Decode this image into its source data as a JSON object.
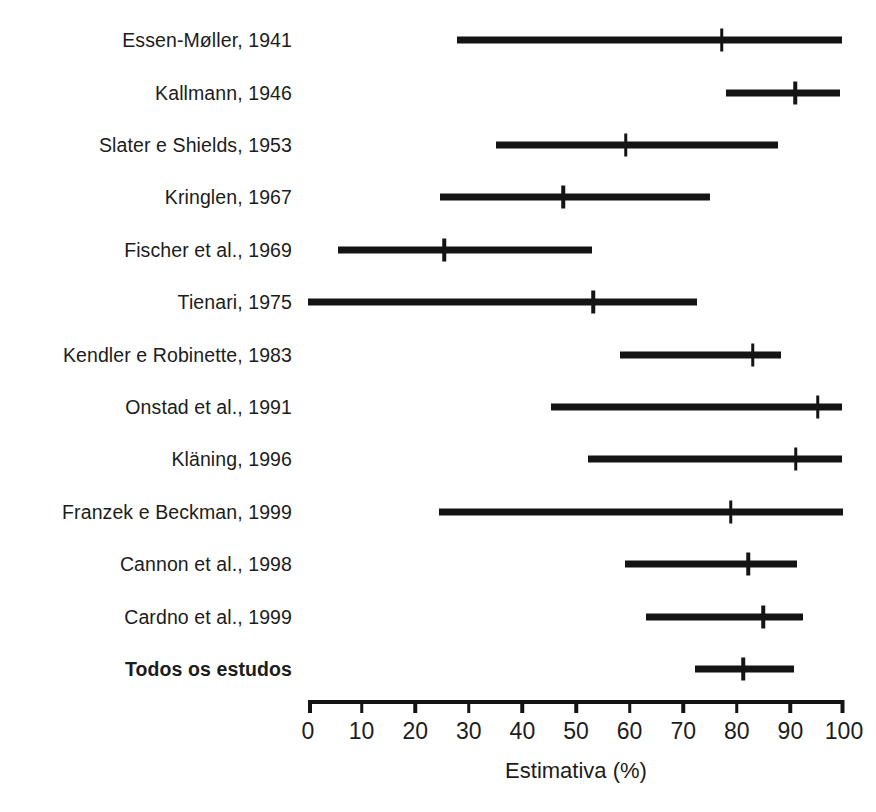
{
  "chart_data": {
    "type": "bar",
    "subtype": "forest-plot",
    "title": "",
    "xlabel": "Estimativa (%)",
    "ylabel": "",
    "xlim": [
      0,
      100
    ],
    "xticks": [
      0,
      10,
      20,
      30,
      40,
      50,
      60,
      70,
      80,
      90,
      100
    ],
    "xticklabels": [
      "0",
      "10",
      "20",
      "30",
      "40",
      "50",
      "60",
      "70",
      "80",
      "90",
      "100"
    ],
    "grid": false,
    "legend": false,
    "accent_color": "#141414",
    "background_color": "#ffffff",
    "categories": [
      "Essen-Møller, 1941",
      "Kallmann, 1946",
      "Slater e Shields, 1953",
      "Kringlen, 1967",
      "Fischer et al., 1969",
      "Tienari, 1975",
      "Kendler e Robinette, 1983",
      "Onstad et al., 1991",
      "Kläning, 1996",
      "Franzek e Beckman, 1999",
      "Cannon et al., 1998",
      "Cardno et al., 1999",
      "Todos os estudos"
    ],
    "series": [
      {
        "name": "Estimativa (%)",
        "values": [
          77.2,
          90.9,
          59.3,
          47.6,
          25.4,
          53.2,
          83.0,
          95.1,
          91.0,
          78.9,
          82.1,
          84.9,
          81.2
        ]
      },
      {
        "name": "IC inferior",
        "values": [
          27.8,
          78.0,
          35.1,
          24.6,
          5.6,
          0.0,
          58.2,
          45.3,
          52.2,
          24.4,
          59.1,
          63.1,
          72.2
        ]
      },
      {
        "name": "IC superior",
        "values": [
          99.6,
          99.3,
          87.7,
          75.0,
          53.0,
          72.6,
          88.2,
          99.6,
          99.6,
          99.8,
          91.2,
          92.4,
          90.7
        ]
      }
    ],
    "rows": [
      {
        "label": "Essen-Møller, 1941",
        "estimate": 77.2,
        "low": 27.8,
        "high": 99.6,
        "summary": false
      },
      {
        "label": "Kallmann, 1946",
        "estimate": 90.9,
        "low": 78.0,
        "high": 99.3,
        "summary": false
      },
      {
        "label": "Slater e Shields, 1953",
        "estimate": 59.3,
        "low": 35.1,
        "high": 87.7,
        "summary": false
      },
      {
        "label": "Kringlen, 1967",
        "estimate": 47.6,
        "low": 24.6,
        "high": 75.0,
        "summary": false
      },
      {
        "label": "Fischer et al., 1969",
        "estimate": 25.4,
        "low": 5.6,
        "high": 53.0,
        "summary": false
      },
      {
        "label": "Tienari, 1975",
        "estimate": 53.2,
        "low": 0.0,
        "high": 72.6,
        "summary": false
      },
      {
        "label": "Kendler e Robinette, 1983",
        "estimate": 83.0,
        "low": 58.2,
        "high": 88.2,
        "summary": false
      },
      {
        "label": "Onstad et al., 1991",
        "estimate": 95.1,
        "low": 45.3,
        "high": 99.6,
        "summary": false
      },
      {
        "label": "Kläning, 1996",
        "estimate": 91.0,
        "low": 52.2,
        "high": 99.6,
        "summary": false
      },
      {
        "label": "Franzek e Beckman, 1999",
        "estimate": 78.9,
        "low": 24.4,
        "high": 99.8,
        "summary": false
      },
      {
        "label": "Cannon et al., 1998",
        "estimate": 82.1,
        "low": 59.1,
        "high": 91.2,
        "summary": false
      },
      {
        "label": "Cardno et al., 1999",
        "estimate": 84.9,
        "low": 63.1,
        "high": 92.4,
        "summary": false
      },
      {
        "label": "Todos os estudos",
        "estimate": 81.2,
        "low": 72.2,
        "high": 90.7,
        "summary": true
      }
    ]
  },
  "axis": {
    "title": "Estimativa (%)",
    "ticks": [
      "0",
      "10",
      "20",
      "30",
      "40",
      "50",
      "60",
      "70",
      "80",
      "90",
      "100"
    ]
  }
}
